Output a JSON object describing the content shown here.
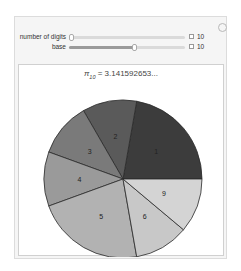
{
  "controls": {
    "settings_icon": "gear-icon",
    "sliders": [
      {
        "label": "number of digits",
        "value": "10",
        "position": 0.0
      },
      {
        "label": "base",
        "value": "10",
        "position": 0.57
      }
    ]
  },
  "chart": {
    "title_symbol": "π",
    "title_subscript": "10",
    "title_rest": " = 3.141592653..."
  },
  "chart_data": {
    "type": "pie",
    "categories": [
      "1",
      "2",
      "3",
      "4",
      "5",
      "6",
      "9"
    ],
    "values": [
      2,
      1,
      1,
      1,
      2,
      1,
      1
    ],
    "colors": [
      "#3c3c3c",
      "#5a5a5a",
      "#7a7a7a",
      "#9a9a9a",
      "#b2b2b2",
      "#c8c8c8",
      "#d4d4d4"
    ],
    "start_angle_deg": 0,
    "direction": "counterclockwise",
    "legend": "none",
    "labels_on_slices": true
  }
}
